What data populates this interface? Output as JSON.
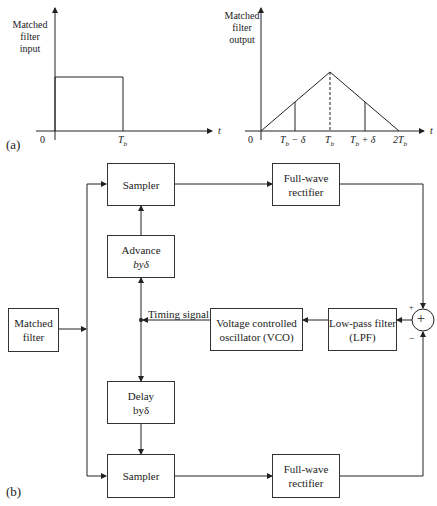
{
  "part_a": {
    "tag": "(a)",
    "input_plot": {
      "ylabel": [
        "Matched",
        "filter",
        "input"
      ],
      "xlabel": "t",
      "ticks": {
        "origin": "0",
        "tb": "T_b"
      }
    },
    "output_plot": {
      "ylabel": [
        "Matched",
        "filter",
        "output"
      ],
      "xlabel": "t",
      "ticks": {
        "origin": "0",
        "tb_minus": "T_b − δ",
        "tb": "T_b",
        "tb_plus": "T_b + δ",
        "two_tb": "2T_b"
      }
    }
  },
  "part_b": {
    "tag": "(b)",
    "blocks": {
      "matched_filter": [
        "Matched",
        "filter"
      ],
      "sampler_top": [
        "Sampler"
      ],
      "advance": [
        "Advance",
        "byδ"
      ],
      "delay": [
        "Delay",
        "byδ"
      ],
      "sampler_bottom": [
        "Sampler"
      ],
      "rectifier_top": [
        "Full-wave",
        "rectifier"
      ],
      "rectifier_bottom": [
        "Full-wave",
        "rectifier"
      ],
      "vco": [
        "Voltage controlled",
        "oscillator (VCO)"
      ],
      "lpf": [
        "Low-pass filter",
        "(LPF)"
      ]
    },
    "summer": {
      "symbol": "+",
      "plus_sign": "+",
      "minus_sign": "−"
    },
    "timing_signal_label": "Timing signal"
  }
}
